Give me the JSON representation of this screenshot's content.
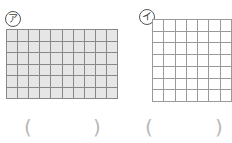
{
  "figures": [
    {
      "label": "ア",
      "columns": 10,
      "rows": 6,
      "fill": "#e6e6e6",
      "line_color": "#888888",
      "answer_open": "(",
      "answer_close": ")"
    },
    {
      "label": "イ",
      "columns": 7,
      "rows": 7,
      "fill": "#ffffff",
      "line_color": "#9a9a9a",
      "answer_open": "(",
      "answer_close": ")"
    }
  ]
}
